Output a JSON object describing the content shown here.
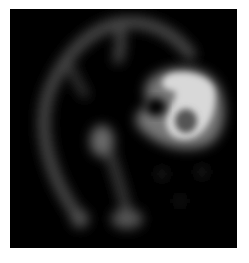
{
  "image": {
    "description": "Grayscale axial brain scan slice (SPECT/PET-like) with a bright focal uptake region in the upper right",
    "background_color": "#000000",
    "frame_color": "#ffffff",
    "regions": [
      {
        "name": "cortical-rim",
        "intensity": "medium"
      },
      {
        "name": "focal-hotspot",
        "intensity": "high"
      },
      {
        "name": "hotspot-center-cold",
        "intensity": "medium-low"
      },
      {
        "name": "central-blob",
        "intensity": "medium"
      },
      {
        "name": "lower-midline-blob",
        "intensity": "medium"
      }
    ]
  }
}
